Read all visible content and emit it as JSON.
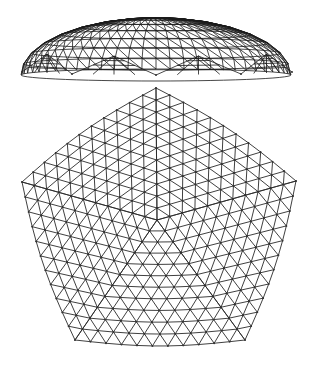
{
  "figure": {
    "title": "Geodesic dome: elevation and plan view",
    "background": "#ffffff",
    "stroke_color": "#2a2a2a"
  },
  "elevation": {
    "label": "Dome elevation (side view)",
    "center_x": 156,
    "base_y": 75,
    "crown_y": 18,
    "half_width": 135,
    "edge_drop": 8,
    "rings": 8,
    "segments": 30,
    "eaves_points": [
      [
        22,
        72
      ],
      [
        72,
        74
      ],
      [
        156,
        75
      ],
      [
        241,
        74
      ],
      [
        292,
        72
      ]
    ]
  },
  "plan": {
    "label": "Dome plan (top view, pentagonal triangulated grid)",
    "frequency": 11,
    "vertices": {
      "top": [
        156,
        88
      ],
      "left": [
        22,
        182
      ],
      "right": [
        296,
        181
      ],
      "bottom_left": [
        75,
        340
      ],
      "bottom_right": [
        245,
        340
      ]
    },
    "center": [
      157,
      220
    ],
    "edge_bulge": 6
  }
}
